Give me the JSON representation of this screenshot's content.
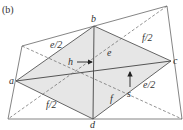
{
  "panel_label": "(b)",
  "vertices": {
    "a": "a",
    "b": "b",
    "c": "c",
    "d": "d"
  },
  "edge_labels": {
    "ab": "e/2",
    "bc": "f/2",
    "ad": "f/2",
    "cd": "e/2"
  },
  "inner_labels": {
    "h": "h",
    "e": "e",
    "s": "s",
    "f": "f"
  },
  "colors": {
    "shade": "#e6e6e6",
    "line": "#555555"
  }
}
